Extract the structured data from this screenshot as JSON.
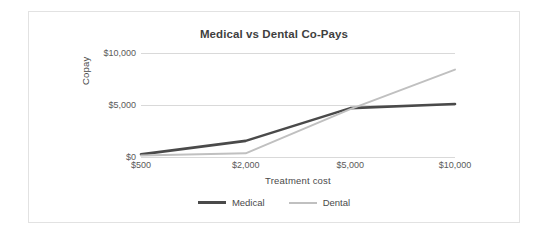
{
  "chart_data": {
    "type": "line",
    "title": "Medical vs Dental Co-Pays",
    "xlabel": "Treatment cost",
    "ylabel": "Copay",
    "categories": [
      "$500",
      "$2,000",
      "$5,000",
      "$10,000"
    ],
    "x_values": [
      500,
      2000,
      5000,
      10000
    ],
    "series": [
      {
        "name": "Medical",
        "color": "#4a4a4a",
        "values": [
          250,
          1550,
          4700,
          5100
        ]
      },
      {
        "name": "Dental",
        "color": "#c0c0c0",
        "values": [
          150,
          350,
          4600,
          8400
        ]
      }
    ],
    "ylim": [
      0,
      10000
    ],
    "y_ticks": [
      0,
      5000,
      10000
    ],
    "y_tick_labels": [
      "$0",
      "$5,000",
      "$10,000"
    ],
    "grid": true,
    "grid_axis": "y",
    "legend_position": "bottom",
    "background_color": "#ffffff",
    "border_color": "#e2e2e2",
    "gridline_color": "#d9d9d9"
  }
}
